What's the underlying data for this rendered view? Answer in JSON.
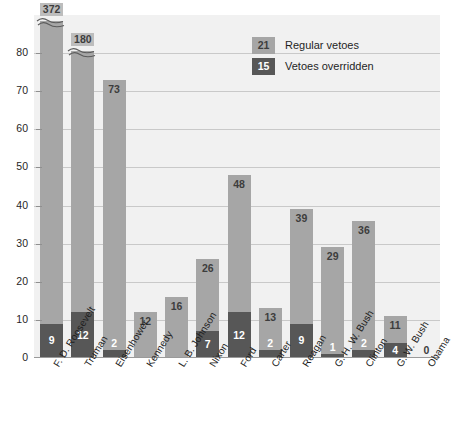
{
  "chart_data": {
    "type": "bar",
    "title": "",
    "subtitle": "",
    "xlabel": "",
    "ylabel": "",
    "ylim": [
      0,
      90
    ],
    "yticks": [
      0,
      10,
      20,
      30,
      40,
      50,
      60,
      70,
      80
    ],
    "grid": true,
    "stacked": true,
    "legend_position": "top-right",
    "note": "Bars for F. D. Roosevelt (372) and Truman (180) exceed the axis and are drawn with a broken-axis wavy mark.",
    "categories": [
      "F. D. Roosevelt",
      "Truman",
      "Eisenhower",
      "Kennedy",
      "L. B. Johnson",
      "Nixon",
      "Ford",
      "Carter",
      "Reagan",
      "G. H. W. Bush",
      "Clinton",
      "G. W. Bush",
      "Obama"
    ],
    "series": [
      {
        "name": "Regular vetoes",
        "color": "#a6a6a6",
        "values": [
          372,
          180,
          73,
          12,
          16,
          26,
          48,
          13,
          39,
          29,
          36,
          11,
          0
        ]
      },
      {
        "name": "Vetoes overridden",
        "color": "#575757",
        "values": [
          9,
          12,
          2,
          0,
          0,
          7,
          12,
          2,
          9,
          1,
          2,
          4,
          0
        ]
      }
    ],
    "bars": [
      {
        "category": "F. D. Roosevelt",
        "total": 372,
        "total_label": "372",
        "overridden": 9,
        "overridden_label": "9",
        "broken": true,
        "show_total_label": true
      },
      {
        "category": "Truman",
        "total": 180,
        "total_label": "180",
        "overridden": 12,
        "overridden_label": "12",
        "broken": true,
        "show_total_label": true
      },
      {
        "category": "Eisenhower",
        "total": 73,
        "total_label": "73",
        "overridden": 2,
        "overridden_label": "2",
        "broken": false,
        "show_total_label": true
      },
      {
        "category": "Kennedy",
        "total": 12,
        "total_label": "12",
        "overridden": 0,
        "overridden_label": "",
        "broken": false,
        "show_total_label": true
      },
      {
        "category": "L. B. Johnson",
        "total": 16,
        "total_label": "16",
        "overridden": 0,
        "overridden_label": "",
        "broken": false,
        "show_total_label": true
      },
      {
        "category": "Nixon",
        "total": 26,
        "total_label": "26",
        "overridden": 7,
        "overridden_label": "7",
        "broken": false,
        "show_total_label": true
      },
      {
        "category": "Ford",
        "total": 48,
        "total_label": "48",
        "overridden": 12,
        "overridden_label": "12",
        "broken": false,
        "show_total_label": true
      },
      {
        "category": "Carter",
        "total": 13,
        "total_label": "13",
        "overridden": 2,
        "overridden_label": "2",
        "broken": false,
        "show_total_label": true
      },
      {
        "category": "Reagan",
        "total": 39,
        "total_label": "39",
        "overridden": 9,
        "overridden_label": "9",
        "broken": false,
        "show_total_label": true
      },
      {
        "category": "G. H. W. Bush",
        "total": 29,
        "total_label": "29",
        "overridden": 1,
        "overridden_label": "1",
        "broken": false,
        "show_total_label": true
      },
      {
        "category": "Clinton",
        "total": 36,
        "total_label": "36",
        "overridden": 2,
        "overridden_label": "2",
        "broken": false,
        "show_total_label": true
      },
      {
        "category": "G. W. Bush",
        "total": 11,
        "total_label": "11",
        "overridden": 4,
        "overridden_label": "4",
        "broken": false,
        "show_total_label": true
      },
      {
        "category": "Obama",
        "total": 0,
        "total_label": "0",
        "overridden": 0,
        "overridden_label": "",
        "broken": false,
        "show_total_label": true
      }
    ]
  },
  "legend": {
    "items": [
      {
        "value": "21",
        "label": "Regular vetoes",
        "style": "light"
      },
      {
        "value": "15",
        "label": "Vetoes overridden",
        "style": "dark"
      }
    ]
  },
  "colors": {
    "plot_background": "#f1f1f1",
    "bar_light": "#a6a6a6",
    "bar_dark": "#575757",
    "gridline": "#c9c9c9",
    "text": "#1f1f1f",
    "page_background": "#ffffff"
  }
}
